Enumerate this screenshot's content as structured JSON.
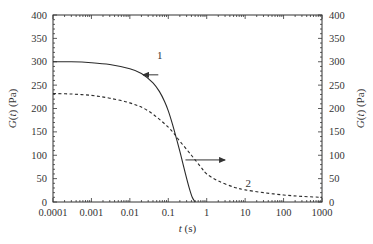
{
  "chart_data": {
    "type": "line",
    "title": "",
    "xlabel": "t (s)",
    "ylabel_left": "G(t) (Pa)",
    "ylabel_right": "G(t) (Pa)",
    "xscale": "log",
    "xlim": [
      0.0001,
      1000
    ],
    "ylim": [
      0,
      400
    ],
    "x_ticks": [
      "0.0001",
      "0.001",
      "0.01",
      "0.1",
      "1",
      "10",
      "100",
      "1000"
    ],
    "y_ticks": [
      "0",
      "50",
      "100",
      "150",
      "200",
      "250",
      "300",
      "350",
      "400"
    ],
    "grid": false,
    "legend": "none",
    "series": [
      {
        "name": "1",
        "style": "solid",
        "axis": "left",
        "x": [
          0.0001,
          0.0003,
          0.001,
          0.003,
          0.01,
          0.02,
          0.04,
          0.06,
          0.08,
          0.1,
          0.13,
          0.17,
          0.22,
          0.28,
          0.35,
          0.42,
          0.5
        ],
        "y": [
          300,
          300,
          298,
          294,
          285,
          275,
          255,
          235,
          215,
          195,
          165,
          130,
          95,
          60,
          30,
          10,
          0
        ]
      },
      {
        "name": "2",
        "style": "dashed",
        "axis": "right",
        "x": [
          0.0001,
          0.0003,
          0.001,
          0.003,
          0.01,
          0.03,
          0.1,
          0.2,
          0.4,
          0.7,
          1,
          2,
          5,
          10,
          30,
          100,
          300,
          1000
        ],
        "y": [
          232,
          231,
          228,
          222,
          212,
          195,
          160,
          130,
          100,
          75,
          60,
          45,
          32,
          26,
          20,
          15,
          12,
          10
        ]
      }
    ],
    "annotations": [
      {
        "text": "1",
        "x": 0.06,
        "y": 305
      },
      {
        "text": "2",
        "x": 12,
        "y": 32
      },
      {
        "type": "arrow",
        "direction": "left",
        "from_x": 0.055,
        "to_x": 0.022,
        "y": 272,
        "meaning": "curve 1 uses left axis"
      },
      {
        "type": "arrow",
        "direction": "right",
        "from_x": 0.28,
        "to_x": 3.0,
        "y": 90,
        "meaning": "curve 2 uses right axis"
      }
    ]
  }
}
